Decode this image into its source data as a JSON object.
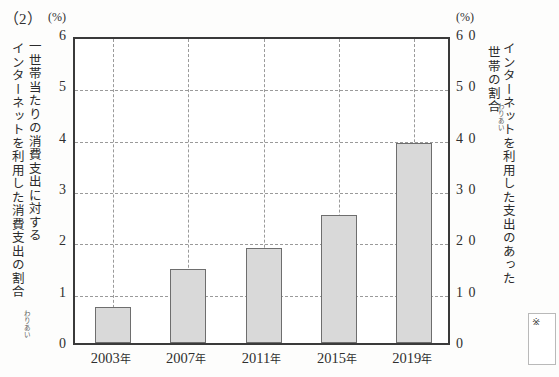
{
  "question_number": "（2）",
  "unit_left": "(%)",
  "unit_right": "(%)",
  "axis_title_left_inner": "一世帯当たりの消費支出に対する消費支出の割合",
  "axis_title_left_outer": "インターネットを利用した",
  "axis_title_left_col_a": "一世帯当たりの消費支出に対する",
  "axis_title_left_col_b": "インターネットを利用した消費支出の",
  "axis_title_left_tail": "割合",
  "axis_title_right_col_a": "インターネットを利用した支出のあった",
  "axis_title_right_col_b": "世帯の割合",
  "ruby_left": "わりあい",
  "ruby_right": "わりあい",
  "reference_mark": "※",
  "colors": {
    "bar_fill": "#d9d9d9",
    "bar_stroke": "#6e6e6e",
    "frame": "#3a3a3a",
    "grid": "#9a9a9a",
    "text": "#2f2f2f",
    "page_bg": "#fdfdfc"
  },
  "chart_data": {
    "type": "bar",
    "title": "",
    "subtitle": "",
    "categories": [
      "2003年",
      "2007年",
      "2011年",
      "2015年",
      "2019年"
    ],
    "values": [
      0.7,
      1.45,
      1.85,
      2.5,
      3.9
    ],
    "series": [
      {
        "name": "一世帯当たりの消費支出に対するインターネットを利用した消費支出の割合",
        "values": [
          0.7,
          1.45,
          1.85,
          2.5,
          3.9
        ]
      }
    ],
    "xlabel": "",
    "ylabel": "一世帯当たりの消費支出に対するインターネットを利用した消費支出の割合",
    "ylabel_right": "インターネットを利用した支出のあった世帯の割合",
    "ylim": [
      0,
      6
    ],
    "ylim_right": [
      0,
      60
    ],
    "yticks": [
      0,
      1,
      2,
      3,
      4,
      5,
      6
    ],
    "yticks_right": [
      0,
      10,
      20,
      30,
      40,
      50,
      60
    ],
    "ytick_labels": [
      "0",
      "1",
      "2",
      "3",
      "4",
      "5",
      "6"
    ],
    "ytick_labels_right": [
      "0",
      "1 0",
      "2 0",
      "3 0",
      "4 0",
      "5 0",
      "6 0"
    ],
    "yunit": "(%)",
    "yunit_right": "(%)",
    "grid": true,
    "grid_style": "dashed",
    "legend": "none",
    "bar_color": "#d9d9d9"
  }
}
